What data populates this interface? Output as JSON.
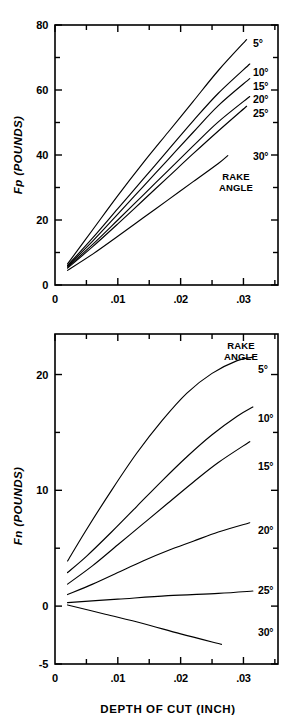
{
  "figure": {
    "background": "#ffffff",
    "line_color": "#000000"
  },
  "chart_data": [
    {
      "type": "line",
      "id": "fp-chart",
      "title": "",
      "ylabel": "Fp  (POUNDS)",
      "ylabel_parts": {
        "symbol": "Fp",
        "units": "(POUNDS)"
      },
      "xlabel": "",
      "xlim": [
        0,
        0.0355
      ],
      "ylim": [
        0,
        80
      ],
      "grid": false,
      "legend_position": "right-inside",
      "legend_caption": "RAKE ANGLE",
      "legend_caption_lines": [
        "RAKE",
        "ANGLE"
      ],
      "xticks": [
        0,
        0.01,
        0.02,
        0.03
      ],
      "xticklabels": [
        "0",
        ".01",
        ".02",
        ".03"
      ],
      "xminorticks": [
        0.005,
        0.015,
        0.025,
        0.035
      ],
      "yticks": [
        0,
        20,
        40,
        60,
        80
      ],
      "yticklabels": [
        "0",
        "20",
        "40",
        "60",
        "80"
      ],
      "yminorticks": [
        10,
        30,
        50,
        70
      ],
      "series": [
        {
          "name": "5°",
          "label": "5°",
          "x": [
            0.002,
            0.006,
            0.01,
            0.014,
            0.018,
            0.022,
            0.026,
            0.0305
          ],
          "values": [
            6.5,
            17.0,
            27.5,
            37.5,
            47.0,
            56.5,
            66.0,
            75.5
          ]
        },
        {
          "name": "10°",
          "label": "10°",
          "x": [
            0.002,
            0.006,
            0.01,
            0.014,
            0.018,
            0.022,
            0.026,
            0.031
          ],
          "values": [
            6.0,
            14.5,
            23.5,
            32.5,
            41.5,
            50.5,
            59.0,
            68.0
          ]
        },
        {
          "name": "15°",
          "label": "15°",
          "x": [
            0.002,
            0.006,
            0.01,
            0.014,
            0.018,
            0.022,
            0.026,
            0.031
          ],
          "values": [
            5.8,
            13.5,
            21.8,
            30.2,
            38.6,
            47.0,
            55.2,
            63.5
          ]
        },
        {
          "name": "20°",
          "label": "20°",
          "x": [
            0.002,
            0.006,
            0.01,
            0.014,
            0.018,
            0.022,
            0.026,
            0.031
          ],
          "values": [
            5.5,
            12.5,
            20.0,
            27.6,
            35.2,
            42.8,
            50.2,
            58.0
          ]
        },
        {
          "name": "25°",
          "label": "25°",
          "x": [
            0.002,
            0.006,
            0.01,
            0.014,
            0.018,
            0.022,
            0.026,
            0.0305
          ],
          "values": [
            5.2,
            11.8,
            18.8,
            26.0,
            33.2,
            40.4,
            47.4,
            55.0
          ]
        },
        {
          "name": "30°",
          "label": "30°",
          "x": [
            0.002,
            0.006,
            0.01,
            0.014,
            0.018,
            0.022,
            0.026,
            0.0275
          ],
          "values": [
            4.5,
            9.5,
            15.0,
            20.6,
            26.2,
            31.8,
            37.4,
            39.8
          ]
        }
      ]
    },
    {
      "type": "line",
      "id": "fn-chart",
      "title": "",
      "ylabel": "Fn  (POUNDS)",
      "ylabel_parts": {
        "symbol": "Fn",
        "units": "(POUNDS)"
      },
      "xlabel": "DEPTH  OF  CUT  (INCH)",
      "xlim": [
        0,
        0.0355
      ],
      "ylim": [
        -5,
        23.5
      ],
      "grid": false,
      "legend_position": "right-inside",
      "legend_caption": "RAKE ANGLE",
      "legend_caption_lines": [
        "RAKE",
        "ANGLE"
      ],
      "xticks": [
        0,
        0.01,
        0.02,
        0.03
      ],
      "xticklabels": [
        "0",
        ".01",
        ".02",
        ".03"
      ],
      "xminorticks": [
        0.005,
        0.015,
        0.025,
        0.035
      ],
      "yticks": [
        -5,
        0,
        10,
        20
      ],
      "yticklabels": [
        "-5",
        "0",
        "10",
        "20"
      ],
      "yminorticks": [
        5,
        15
      ],
      "series": [
        {
          "name": "5°",
          "label": "5°",
          "x": [
            0.002,
            0.005,
            0.009,
            0.013,
            0.017,
            0.021,
            0.025,
            0.029,
            0.0315
          ],
          "values": [
            3.9,
            6.6,
            10.0,
            13.2,
            16.0,
            18.4,
            20.1,
            21.2,
            21.5
          ]
        },
        {
          "name": "10°",
          "label": "10°",
          "x": [
            0.002,
            0.005,
            0.009,
            0.013,
            0.017,
            0.021,
            0.025,
            0.029,
            0.0315
          ],
          "values": [
            2.9,
            4.3,
            6.4,
            8.6,
            10.8,
            12.9,
            14.8,
            16.4,
            17.2
          ]
        },
        {
          "name": "15°",
          "label": "15°",
          "x": [
            0.002,
            0.006,
            0.01,
            0.014,
            0.018,
            0.022,
            0.026,
            0.031
          ],
          "values": [
            1.9,
            3.5,
            5.3,
            7.1,
            8.9,
            10.7,
            12.4,
            14.2
          ]
        },
        {
          "name": "20°",
          "label": "20°",
          "x": [
            0.002,
            0.006,
            0.01,
            0.014,
            0.018,
            0.022,
            0.026,
            0.031
          ],
          "values": [
            1.0,
            1.9,
            2.9,
            3.9,
            4.8,
            5.6,
            6.4,
            7.2
          ]
        },
        {
          "name": "25°",
          "label": "25°",
          "x": [
            0.002,
            0.01,
            0.018,
            0.026,
            0.0315
          ],
          "values": [
            0.3,
            0.6,
            0.9,
            1.1,
            1.3
          ]
        },
        {
          "name": "30°",
          "label": "30°",
          "x": [
            0.002,
            0.008,
            0.014,
            0.02,
            0.0265
          ],
          "values": [
            0.1,
            -0.7,
            -1.5,
            -2.4,
            -3.3
          ]
        }
      ]
    }
  ]
}
